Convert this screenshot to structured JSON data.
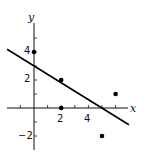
{
  "chart_data": {
    "type": "scatter",
    "title": "",
    "xlabel": "x",
    "ylabel": "y",
    "xlim": [
      -2,
      7
    ],
    "ylim": [
      -3,
      6
    ],
    "grid": false,
    "x_ticks": [
      -1,
      1,
      2,
      3,
      4,
      5,
      6
    ],
    "x_tick_labels": [
      {
        "value": 2,
        "label": "2"
      },
      {
        "value": 4,
        "label": "4"
      }
    ],
    "y_ticks": [
      -2,
      -1,
      1,
      2,
      3,
      4,
      5
    ],
    "y_tick_labels": [
      {
        "value": 4,
        "label": "4"
      },
      {
        "value": 2,
        "label": "2"
      },
      {
        "value": -2,
        "label": "−2"
      }
    ],
    "series": [
      {
        "name": "data points",
        "type": "scatter",
        "x": [
          0,
          2,
          2,
          5,
          6
        ],
        "y": [
          4,
          2,
          0,
          -2,
          1
        ]
      },
      {
        "name": "regression line",
        "type": "line",
        "slope": -0.6,
        "intercept": 3,
        "x": [
          -2,
          7
        ],
        "y": [
          4.2,
          -1.2
        ]
      }
    ],
    "colors": {
      "axis": "#111111",
      "points": "#000000",
      "line": "#000000"
    }
  },
  "labels": {
    "x_axis": "x",
    "y_axis": "y",
    "tick_2": "2",
    "tick_4": "4",
    "tick_y4": "4",
    "tick_y2": "2",
    "tick_ym2": "−2"
  }
}
